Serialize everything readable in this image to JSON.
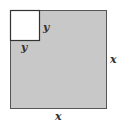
{
  "diagram": {
    "outer_square": {
      "side_label": "x",
      "fill": "#c8c8c8",
      "stroke": "#555555"
    },
    "inner_square": {
      "side_label": "y",
      "fill": "#ffffff",
      "stroke": "#333333"
    },
    "labels": {
      "inner_right": "y",
      "inner_bottom": "y",
      "outer_right": "x",
      "outer_bottom": "x"
    }
  }
}
